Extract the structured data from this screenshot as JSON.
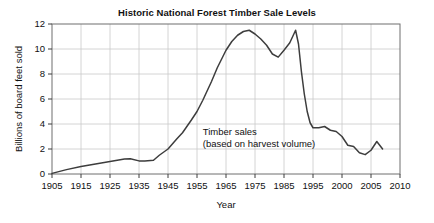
{
  "chart_data": {
    "type": "line",
    "title": "Historic National Forest Timber Sale Levels",
    "xlabel": "Year",
    "ylabel": "Billions of board feet sold",
    "xlim": [
      1905,
      2010
    ],
    "ylim": [
      0,
      12
    ],
    "grid": true,
    "legend_position": "none",
    "xticks": [
      1905,
      1915,
      1925,
      1935,
      1945,
      1955,
      1965,
      1975,
      1985,
      1995,
      2000,
      2005,
      2010
    ],
    "xtick_labels": [
      "1905",
      "1915",
      "1925",
      "1935",
      "1945",
      "1955",
      "1965",
      "1975",
      "1985",
      "1995",
      "2000",
      "2005",
      "2010"
    ],
    "yticks": [
      0,
      2,
      4,
      6,
      8,
      10,
      12
    ],
    "ytick_labels": [
      "0",
      "2",
      "4",
      "6",
      "8",
      "10",
      "12"
    ],
    "annotations": [
      {
        "name": "timber-sales-annotation",
        "line1": "Timber sales",
        "line2": "(based on harvest volume)",
        "x": 1957,
        "y": 3.1
      }
    ],
    "series": [
      {
        "name": "Timber sales (based on harvest volume)",
        "color": "#3d3d3d",
        "x": [
          1905,
          1910,
          1915,
          1920,
          1925,
          1930,
          1932,
          1935,
          1937,
          1940,
          1942,
          1945,
          1948,
          1950,
          1953,
          1955,
          1957,
          1960,
          1962,
          1965,
          1967,
          1969,
          1971,
          1973,
          1975,
          1977,
          1979,
          1981,
          1983,
          1985,
          1987,
          1989,
          1990,
          1991,
          1992,
          1993,
          1994,
          1995,
          1996,
          1997,
          1998,
          1999,
          2000,
          2001,
          2002,
          2003,
          2004,
          2005,
          2006,
          2007
        ],
        "values": [
          0.05,
          0.35,
          0.6,
          0.8,
          1.0,
          1.2,
          1.22,
          1.05,
          1.05,
          1.1,
          1.5,
          2.0,
          2.8,
          3.3,
          4.3,
          5.0,
          5.9,
          7.4,
          8.5,
          9.9,
          10.6,
          11.1,
          11.4,
          11.5,
          11.2,
          10.8,
          10.3,
          9.6,
          9.35,
          9.9,
          10.5,
          11.5,
          10.4,
          8.2,
          6.4,
          5.0,
          4.1,
          3.7,
          3.7,
          3.8,
          3.5,
          3.4,
          3.0,
          2.3,
          2.2,
          1.7,
          1.55,
          1.9,
          2.6,
          2.0
        ]
      }
    ]
  }
}
